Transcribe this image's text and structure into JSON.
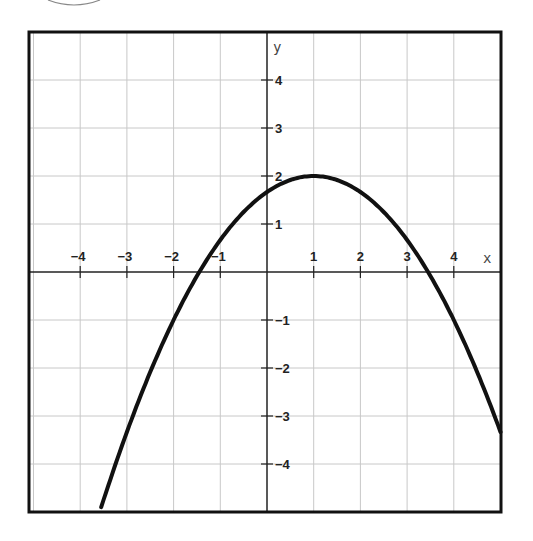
{
  "chart_data": {
    "type": "line",
    "title": "",
    "xlabel": "x",
    "ylabel": "y",
    "xlim": [
      -5,
      5
    ],
    "ylim": [
      -5,
      5
    ],
    "grid": true,
    "x_ticks": [
      -4,
      -3,
      -2,
      -1,
      1,
      2,
      3,
      4
    ],
    "y_ticks": [
      -4,
      -3,
      -2,
      -1,
      1,
      2,
      3,
      4
    ],
    "x_tick_labels": [
      "−4",
      "−3",
      "−2",
      "−1",
      "1",
      "2",
      "3",
      "4"
    ],
    "y_tick_labels": [
      "−4",
      "−3",
      "−2",
      "−1",
      "1",
      "2",
      "3",
      "4"
    ],
    "series": [
      {
        "name": "parabola",
        "equation": "y = -(1/3)(x - 1)^2 + 2",
        "vertex": [
          1,
          2
        ],
        "x_intercepts": [
          -1.45,
          3.45
        ],
        "y_intercept": 1.67,
        "x": [
          -3.5,
          -3,
          -2,
          -1,
          0,
          1,
          2,
          3,
          4,
          5
        ],
        "values": [
          -4.75,
          -3.33,
          -1.0,
          0.67,
          1.67,
          2.0,
          1.67,
          0.67,
          -1.0,
          -3.33
        ]
      }
    ]
  },
  "axes": {
    "x_label": "x",
    "y_label": "y"
  }
}
